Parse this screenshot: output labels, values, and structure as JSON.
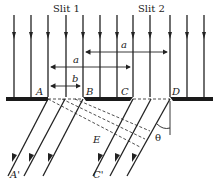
{
  "diagram": {
    "slit_labels": [
      "Slit 1",
      "Slit 2"
    ],
    "points": {
      "A": "A",
      "B": "B",
      "C": "C",
      "D": "D",
      "E": "E",
      "A_prime": "A'",
      "C_prime": "C'"
    },
    "dimensions": {
      "a_top": "a",
      "a_middle": "a",
      "b": "b"
    },
    "angle": "θ",
    "colors": {
      "ink": "#222222",
      "plate": "#1a1a1a",
      "background": "#ffffff"
    }
  }
}
